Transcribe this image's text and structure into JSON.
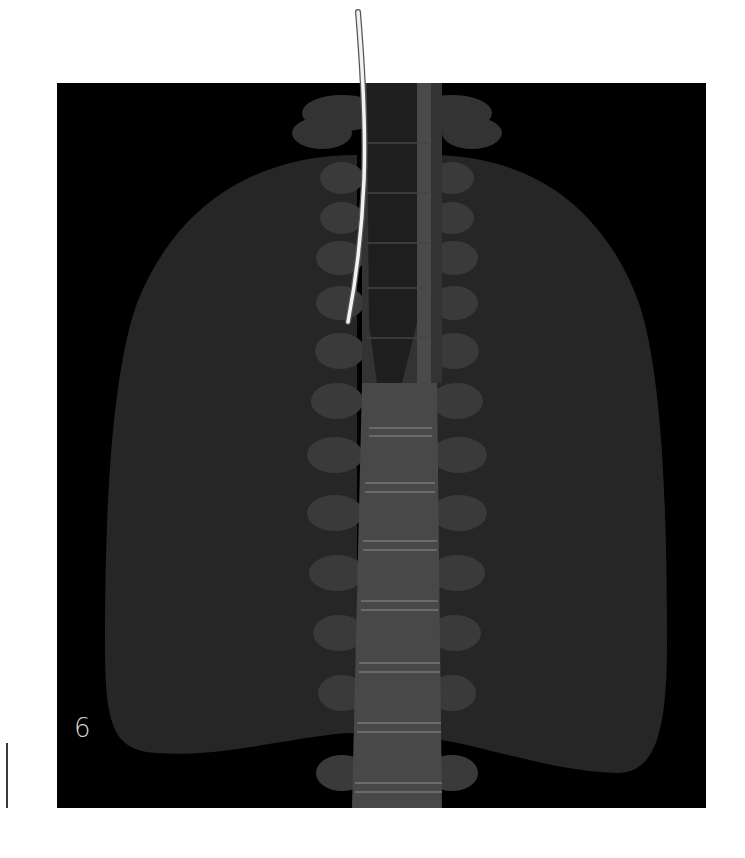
{
  "figure": {
    "panel_number": "6",
    "colors": {
      "background": "#ffffff",
      "panel": "#000000",
      "lung": "#262626",
      "bone": "#3c3c3c",
      "vertebral_body": "#4a4a4a",
      "trachea": "#1c1c1c",
      "tube": "#f2f2f2",
      "side_rule": "#3a3a3a"
    },
    "elements": [
      "left-lung",
      "right-lung",
      "spine",
      "trachea",
      "clavicles",
      "tube"
    ]
  }
}
